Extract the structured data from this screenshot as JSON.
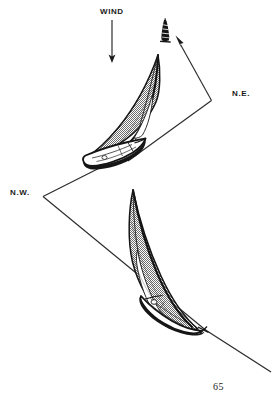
{
  "page": {
    "width": 280,
    "height": 404,
    "background": "#ffffff",
    "page_number": "65"
  },
  "labels": {
    "wind": "WIND",
    "northeast": "N.E.",
    "northwest": "N.W."
  },
  "colors": {
    "ink": "#1a1a1a",
    "line": "#333333",
    "sail_fill": "#9a9a9a",
    "hull_fill": "#ffffff",
    "paper": "#ffffff"
  },
  "figure": {
    "caption_number": "65",
    "type": "line-illustration",
    "elements": [
      {
        "name": "wind-arrow",
        "label": "WIND",
        "direction": "down",
        "from": [
          112,
          20
        ],
        "to": [
          112,
          62
        ]
      },
      {
        "name": "distant-boat",
        "description": "small dark boat seen head-on near horizon",
        "at": [
          165,
          30
        ]
      },
      {
        "name": "upper-sailboat",
        "description": "sailboat heeling to port with crescent sail",
        "mast_top": [
          158,
          55
        ],
        "bow": [
          90,
          160
        ]
      },
      {
        "name": "lower-sailboat",
        "description": "sailboat heeling with crescent sail, lower right",
        "mast_top": [
          133,
          190
        ],
        "bow": [
          205,
          330
        ]
      },
      {
        "name": "northeast-course-line",
        "label": "N.E.",
        "vertex": [
          212,
          100
        ],
        "arrow_to": [
          178,
          42
        ],
        "tail_to": [
          128,
          160
        ]
      },
      {
        "name": "northwest-course-line",
        "label": "N.W.",
        "vertex": [
          43,
          196
        ],
        "upper_to": [
          100,
          168
        ],
        "lower_to": [
          205,
          330
        ]
      },
      {
        "name": "trailing-course-line",
        "from": [
          205,
          330
        ],
        "to": [
          271,
          372
        ]
      }
    ]
  }
}
